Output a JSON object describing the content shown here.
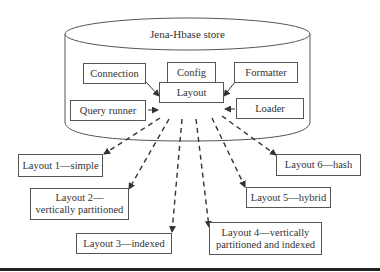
{
  "store": {
    "title": "Jena-Hbase store"
  },
  "components": {
    "connection": "Connection",
    "config": "Config",
    "formatter": "Formatter",
    "layout": "Layout",
    "query_runner": "Query runner",
    "loader": "Loader"
  },
  "layouts": [
    {
      "id": 1,
      "line1": "Layout 1—simple",
      "line2": ""
    },
    {
      "id": 2,
      "line1": "Layout 2—",
      "line2": "vertically partitioned"
    },
    {
      "id": 3,
      "line1": "Layout 3—indexed",
      "line2": ""
    },
    {
      "id": 4,
      "line1": "Layout 4—vertically",
      "line2": "partitioned and indexed"
    },
    {
      "id": 5,
      "line1": "Layout 5—hybrid",
      "line2": ""
    },
    {
      "id": 6,
      "line1": "Layout 6—hash",
      "line2": ""
    }
  ],
  "colors": {
    "stroke": "#555555",
    "text": "#333333",
    "rule": "#222222"
  }
}
